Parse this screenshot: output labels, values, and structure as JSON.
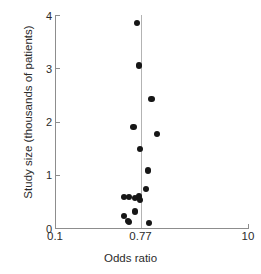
{
  "chart_data": {
    "type": "scatter",
    "title": "",
    "xlabel": "Odds ratio",
    "ylabel": "Study size (thousands of patients)",
    "xscale": "log",
    "xlim": [
      0.1,
      10
    ],
    "ylim": [
      0,
      4
    ],
    "xticks": [
      0.1,
      0.77,
      10
    ],
    "xticklabels": [
      "0.1",
      "0.77",
      "10"
    ],
    "yticks": [
      0,
      1,
      2,
      3,
      4
    ],
    "yticklabels": [
      "0",
      "1",
      "2",
      "3",
      "4"
    ],
    "grid": false,
    "legend": null,
    "reference_line": {
      "orientation": "vertical",
      "x": 0.77,
      "label": "0.77",
      "color": "#b3b3b3"
    },
    "marker": {
      "shape": "circle",
      "color": "#161616",
      "size_px": 6.2
    },
    "series": [
      {
        "name": "Studies",
        "points": [
          {
            "x": 0.71,
            "y": 3.85
          },
          {
            "x": 0.74,
            "y": 3.05
          },
          {
            "x": 1.0,
            "y": 2.42
          },
          {
            "x": 0.65,
            "y": 1.9
          },
          {
            "x": 1.15,
            "y": 1.77
          },
          {
            "x": 0.76,
            "y": 1.48
          },
          {
            "x": 0.92,
            "y": 1.08
          },
          {
            "x": 0.88,
            "y": 0.73
          },
          {
            "x": 0.52,
            "y": 0.58
          },
          {
            "x": 0.59,
            "y": 0.58
          },
          {
            "x": 0.67,
            "y": 0.57
          },
          {
            "x": 0.74,
            "y": 0.59
          },
          {
            "x": 0.76,
            "y": 0.53
          },
          {
            "x": 0.67,
            "y": 0.31
          },
          {
            "x": 0.52,
            "y": 0.22
          },
          {
            "x": 0.57,
            "y": 0.13
          },
          {
            "x": 0.59,
            "y": 0.11
          },
          {
            "x": 0.94,
            "y": 0.1
          }
        ]
      }
    ]
  }
}
